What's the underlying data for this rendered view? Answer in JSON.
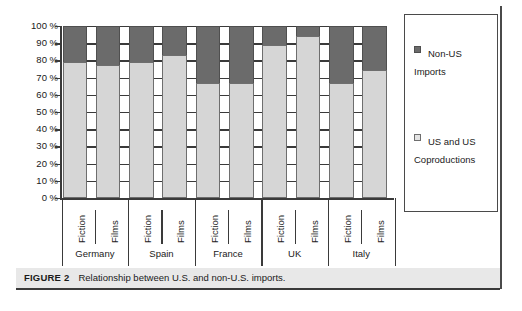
{
  "caption": {
    "figure_number": "FIGURE 2",
    "title": "Relationship between U.S. and non-U.S. imports."
  },
  "legend": {
    "items": [
      {
        "label": "Non-US Imports",
        "swatch": "dark-gray-swatch-icon",
        "color": "#6b6b6b"
      },
      {
        "label": "US and US Coproductions",
        "swatch": "light-gray-swatch-icon",
        "color": "#e4e4e4"
      }
    ]
  },
  "axis": {
    "y_ticks": [
      "100 %",
      "90 %",
      "80 %",
      "70 %",
      "60 %",
      "50 %",
      "40 %",
      "30 %",
      "20 %",
      "10 %",
      "0 %"
    ]
  },
  "chart_data": {
    "type": "bar",
    "stacked": true,
    "normalized_percent": true,
    "title": "Relationship between U.S. and non-U.S. imports.",
    "xlabel": "",
    "ylabel": "",
    "ylim": [
      0,
      100
    ],
    "ytick_step": 10,
    "grid": false,
    "legend_position": "right",
    "groups": [
      "Germany",
      "Spain",
      "France",
      "UK",
      "Italy"
    ],
    "subcategories": [
      "Fiction",
      "Films"
    ],
    "categories": [
      "Germany Fiction",
      "Germany Films",
      "Spain Fiction",
      "Spain Films",
      "France Fiction",
      "France Films",
      "UK Fiction",
      "UK Films",
      "Italy Fiction",
      "Italy Films"
    ],
    "series": [
      {
        "name": "US and US Coproductions",
        "color": "#e4e4e4",
        "values": [
          79,
          77.5,
          79,
          83,
          67,
          67,
          89,
          94,
          67,
          74.5
        ]
      },
      {
        "name": "Non-US Imports",
        "color": "#6b6b6b",
        "values": [
          21,
          22.5,
          21,
          17,
          33,
          33,
          11,
          6,
          33,
          25.5
        ]
      }
    ]
  }
}
